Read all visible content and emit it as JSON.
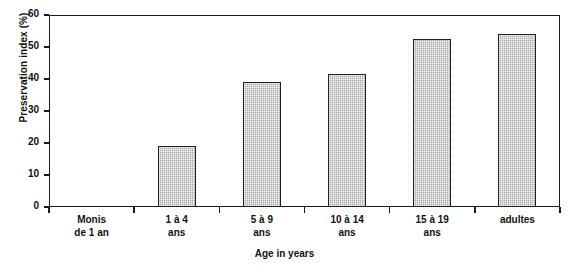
{
  "chart_data": {
    "type": "bar",
    "title": "",
    "xlabel": "Age in years",
    "ylabel": "Preservation index (%)",
    "categories": [
      "Monis\nde 1 an",
      "1 à 4\nans",
      "5 à 9\nans",
      "10 à 14\nans",
      "15 à 19\nans",
      "adultes"
    ],
    "category_lines": [
      [
        "Monis",
        "de 1 an"
      ],
      [
        "1 à 4",
        "ans"
      ],
      [
        "5 à 9",
        "ans"
      ],
      [
        "10 à 14",
        "ans"
      ],
      [
        "15 à 19",
        "ans"
      ],
      [
        "adultes",
        ""
      ]
    ],
    "values": [
      0,
      19,
      39,
      41.5,
      52.5,
      54
    ],
    "ylim": [
      0,
      60
    ],
    "yticks": [
      0,
      10,
      20,
      30,
      40,
      50,
      60
    ],
    "ytick_labels": [
      "0",
      "10",
      "20",
      "30",
      "40",
      "50",
      "60"
    ],
    "grid": false,
    "legend": false,
    "bar_fill_color": "#a9a9a9",
    "bar_edge_color": "#1f1f1f",
    "axis_color": "#1b1b1b"
  }
}
